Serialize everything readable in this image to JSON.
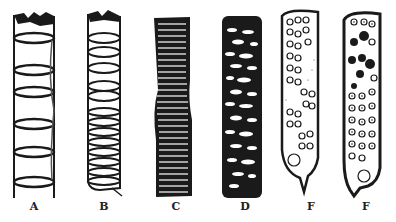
{
  "figure": {
    "panels": [
      {
        "label": "A",
        "type": "annular-vessel"
      },
      {
        "label": "B",
        "type": "spiral-vessel"
      },
      {
        "label": "C",
        "type": "scalariform-vessel"
      },
      {
        "label": "D",
        "type": "reticulate-vessel"
      },
      {
        "label": "F",
        "type": "pitted-vessel"
      },
      {
        "label": "F",
        "type": "pitted-vessel-bordered"
      }
    ],
    "colors": {
      "ink": "#1a1a1a",
      "paper": "#ffffff"
    }
  }
}
